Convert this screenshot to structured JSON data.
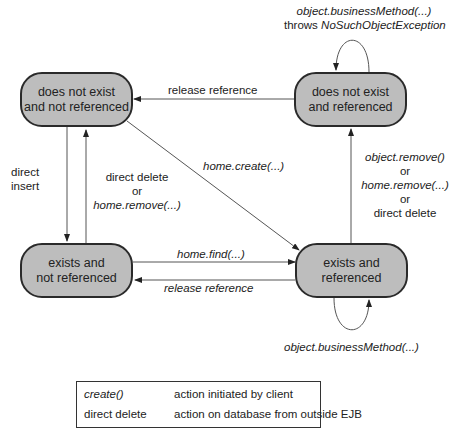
{
  "states": {
    "dne_nr": {
      "line1": "does not exist",
      "line2": "and not referenced"
    },
    "dne_r": {
      "line1": "does not exist",
      "line2": "and referenced"
    },
    "e_nr": {
      "line1": "exists and",
      "line2": "not referenced"
    },
    "e_r": {
      "line1": "exists and",
      "line2": "referenced"
    }
  },
  "transitions": {
    "top_self_loop": {
      "line1": "object.businessMethod(...)",
      "line2_prefix": "throws ",
      "line2_italic": "NoSuchObjectException"
    },
    "release_reference_top": "release reference",
    "direct_insert": {
      "line1": "direct",
      "line2": "insert"
    },
    "direct_delete_left": {
      "line1": "direct delete",
      "line2": "or",
      "line3": "home.remove(...)"
    },
    "home_create": "home.create(...)",
    "remove_right": {
      "line1": "object.remove()",
      "line2": "or",
      "line3": "home.remove(...)",
      "line4": "or",
      "line5": "direct delete"
    },
    "home_find": "home.find(...)",
    "release_reference_bottom": "release reference",
    "bottom_self_loop": "object.businessMethod(...)"
  },
  "legend": {
    "rows": [
      {
        "key": "create()",
        "value": "action initiated by client"
      },
      {
        "key": "direct delete",
        "value": "action on database from outside EJB"
      }
    ]
  }
}
